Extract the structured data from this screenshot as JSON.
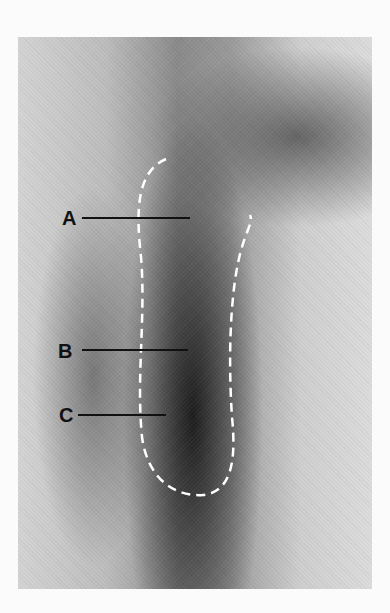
{
  "figure": {
    "type": "scanned black-and-white photograph",
    "caption_clipped": "",
    "labels": [
      {
        "id": "A",
        "text": "A"
      },
      {
        "id": "B",
        "text": "B"
      },
      {
        "id": "C",
        "text": "C"
      }
    ],
    "outline_style": "white dashed outline",
    "colors": {
      "page_background": "#fbfbfb",
      "label_color": "#111111",
      "outline_color": "#ffffff"
    }
  }
}
